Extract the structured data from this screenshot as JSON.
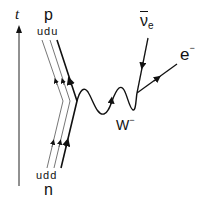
{
  "diagram": {
    "axis": {
      "label": "t",
      "direction": "up"
    },
    "proton": {
      "label": "p",
      "quarks": "udu"
    },
    "neutron": {
      "label": "n",
      "quarks": "udd"
    },
    "boson": {
      "label": "W",
      "charge": "−"
    },
    "antineutrino": {
      "label": "ν",
      "flavor": "e"
    },
    "electron": {
      "label": "e",
      "charge": "−"
    }
  },
  "colors": {
    "line": "#111111",
    "thin_line": "#555555",
    "background": "#ffffff"
  }
}
